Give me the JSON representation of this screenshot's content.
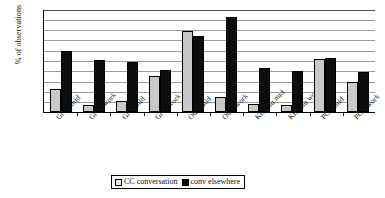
{
  "chart_data": {
    "type": "bar",
    "title": "",
    "xlabel": "",
    "ylabel": "% of observations",
    "ylim": [
      0,
      20
    ],
    "yticks": [
      0,
      2,
      4,
      6,
      8,
      10,
      12,
      14,
      16,
      18,
      20
    ],
    "grid": true,
    "legend_position": "bottom",
    "categories": [
      "Gr W mid",
      "Gr W work",
      "Gr B mid",
      "Gr B work",
      "Oulu mid",
      "Oulu work",
      "Kisumu mid",
      "Kisumu work",
      "POA mid",
      "POA work"
    ],
    "series": [
      {
        "name": "CC conversation",
        "color": "#c9c9c9",
        "values": [
          4.4,
          1.3,
          2.1,
          7.0,
          15.7,
          3.0,
          1.5,
          1.3,
          10.2,
          5.9
        ]
      },
      {
        "name": "conv elsewhere",
        "color": "#0d0d0d",
        "values": [
          11.8,
          10.1,
          9.7,
          8.2,
          14.8,
          18.5,
          8.5,
          7.9,
          10.5,
          7.8
        ]
      }
    ]
  },
  "legend": {
    "items": [
      {
        "label": "CC conversation",
        "swatch": "light-gray-square-icon"
      },
      {
        "label": "conv elsewhere",
        "swatch": "black-square-icon"
      }
    ]
  }
}
